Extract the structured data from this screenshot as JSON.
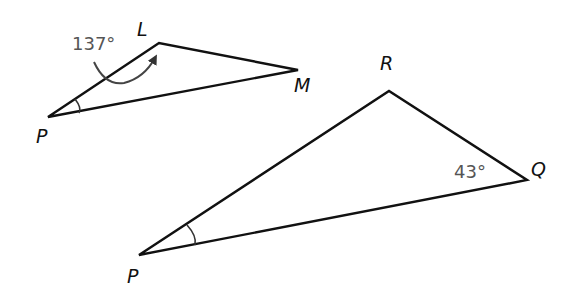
{
  "diagram": {
    "type": "geometry",
    "triangles": [
      {
        "name": "PLM",
        "vertices": {
          "P": {
            "label": "P",
            "x": 48,
            "y": 117
          },
          "L": {
            "label": "L",
            "x": 159,
            "y": 43
          },
          "M": {
            "label": "M",
            "x": 298,
            "y": 70
          }
        },
        "angle_marks": [
          {
            "at": "L",
            "label": "137°",
            "note": "curved arrow from label to angle L"
          },
          {
            "at": "P",
            "label": "",
            "note": "single arc"
          }
        ]
      },
      {
        "name": "PRQ",
        "vertices": {
          "P": {
            "label": "P",
            "x": 139,
            "y": 255
          },
          "R": {
            "label": "R",
            "x": 389,
            "y": 91
          },
          "Q": {
            "label": "Q",
            "x": 527,
            "y": 180
          }
        },
        "angle_marks": [
          {
            "at": "Q",
            "label": "43°"
          },
          {
            "at": "P",
            "label": "",
            "note": "single arc"
          }
        ]
      }
    ],
    "colors": {
      "edge": "#111111",
      "angle_label": "#555555",
      "background": "#ffffff"
    }
  }
}
